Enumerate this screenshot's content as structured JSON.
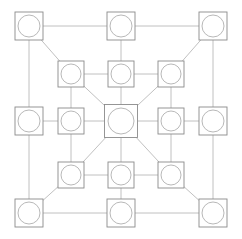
{
  "diagram": {
    "type": "node-link-graph",
    "canvas": {
      "width": 242,
      "height": 239,
      "background": "#ffffff"
    },
    "style": {
      "edge_color": "#b9b9b9",
      "edge_width": 0.9,
      "node_square_stroke": "#8a8a8a",
      "node_square_width": 0.9,
      "node_circle_stroke": "#b0b0b0",
      "node_circle_width": 0.9,
      "node_fill": "#ffffff"
    },
    "grid": {
      "columns_x": [
        29,
        65,
        121,
        177,
        213
      ],
      "rows_y": [
        26,
        74,
        121,
        177,
        213
      ],
      "outer_node_size": 28,
      "inner_node_size": 26,
      "hub_node_size": 33
    },
    "node_count": 17,
    "edge_count": 28,
    "nodes": [
      {
        "id": "n-r1c1",
        "label": "top-left-corner",
        "row": 1,
        "col": 1,
        "cx": 29,
        "cy": 26,
        "size": 28,
        "radius": 11,
        "kind": "corner"
      },
      {
        "id": "n-r1c3",
        "label": "top-center",
        "row": 1,
        "col": 3,
        "cx": 121,
        "cy": 26,
        "size": 28,
        "radius": 11,
        "kind": "edge-mid"
      },
      {
        "id": "n-r1c5",
        "label": "top-right-corner",
        "row": 1,
        "col": 5,
        "cx": 213,
        "cy": 26,
        "size": 28,
        "radius": 11,
        "kind": "corner"
      },
      {
        "id": "n-r2c2",
        "label": "inner-top-left",
        "row": 2,
        "col": 2,
        "cx": 71,
        "cy": 74,
        "size": 26,
        "radius": 10,
        "kind": "inner"
      },
      {
        "id": "n-r2c3",
        "label": "inner-top-center",
        "row": 2,
        "col": 3,
        "cx": 121,
        "cy": 74,
        "size": 26,
        "radius": 10,
        "kind": "inner"
      },
      {
        "id": "n-r2c4",
        "label": "inner-top-right",
        "row": 2,
        "col": 4,
        "cx": 171,
        "cy": 74,
        "size": 26,
        "radius": 10,
        "kind": "inner"
      },
      {
        "id": "n-r3c1",
        "label": "left-middle",
        "row": 3,
        "col": 1,
        "cx": 29,
        "cy": 121,
        "size": 28,
        "radius": 11,
        "kind": "edge-mid"
      },
      {
        "id": "n-r3c2",
        "label": "inner-left",
        "row": 3,
        "col": 2,
        "cx": 71,
        "cy": 121,
        "size": 26,
        "radius": 10,
        "kind": "inner"
      },
      {
        "id": "n-r3c3",
        "label": "center-hub",
        "row": 3,
        "col": 3,
        "cx": 121,
        "cy": 121,
        "size": 33,
        "radius": 13,
        "kind": "hub"
      },
      {
        "id": "n-r3c4",
        "label": "inner-right",
        "row": 3,
        "col": 4,
        "cx": 171,
        "cy": 121,
        "size": 26,
        "radius": 10,
        "kind": "inner"
      },
      {
        "id": "n-r3c5",
        "label": "right-middle",
        "row": 3,
        "col": 5,
        "cx": 213,
        "cy": 121,
        "size": 28,
        "radius": 11,
        "kind": "edge-mid"
      },
      {
        "id": "n-r4c2",
        "label": "inner-bottom-left",
        "row": 4,
        "col": 2,
        "cx": 71,
        "cy": 175,
        "size": 26,
        "radius": 10,
        "kind": "inner"
      },
      {
        "id": "n-r4c3",
        "label": "inner-bottom-center",
        "row": 4,
        "col": 3,
        "cx": 121,
        "cy": 175,
        "size": 26,
        "radius": 10,
        "kind": "inner"
      },
      {
        "id": "n-r4c4",
        "label": "inner-bottom-right",
        "row": 4,
        "col": 4,
        "cx": 171,
        "cy": 175,
        "size": 26,
        "radius": 10,
        "kind": "inner"
      },
      {
        "id": "n-r5c1",
        "label": "bottom-left-corner",
        "row": 5,
        "col": 1,
        "cx": 29,
        "cy": 213,
        "size": 28,
        "radius": 11,
        "kind": "corner"
      },
      {
        "id": "n-r5c3",
        "label": "bottom-center",
        "row": 5,
        "col": 3,
        "cx": 121,
        "cy": 213,
        "size": 28,
        "radius": 11,
        "kind": "edge-mid"
      },
      {
        "id": "n-r5c5",
        "label": "bottom-right-corner",
        "row": 5,
        "col": 5,
        "cx": 213,
        "cy": 213,
        "size": 28,
        "radius": 11,
        "kind": "corner"
      }
    ],
    "edges": [
      {
        "from": "n-r1c1",
        "to": "n-r1c3",
        "orientation": "horizontal"
      },
      {
        "from": "n-r1c3",
        "to": "n-r1c5",
        "orientation": "horizontal"
      },
      {
        "from": "n-r1c1",
        "to": "n-r3c1",
        "orientation": "vertical"
      },
      {
        "from": "n-r1c5",
        "to": "n-r3c5",
        "orientation": "vertical"
      },
      {
        "from": "n-r1c1",
        "to": "n-r2c2",
        "orientation": "diagonal"
      },
      {
        "from": "n-r1c5",
        "to": "n-r2c4",
        "orientation": "diagonal"
      },
      {
        "from": "n-r1c3",
        "to": "n-r2c3",
        "orientation": "vertical"
      },
      {
        "from": "n-r2c2",
        "to": "n-r2c3",
        "orientation": "horizontal"
      },
      {
        "from": "n-r2c3",
        "to": "n-r2c4",
        "orientation": "horizontal"
      },
      {
        "from": "n-r2c2",
        "to": "n-r3c2",
        "orientation": "vertical"
      },
      {
        "from": "n-r2c4",
        "to": "n-r3c4",
        "orientation": "vertical"
      },
      {
        "from": "n-r2c2",
        "to": "n-r3c3",
        "orientation": "diagonal"
      },
      {
        "from": "n-r2c4",
        "to": "n-r3c3",
        "orientation": "diagonal"
      },
      {
        "from": "n-r2c3",
        "to": "n-r3c3",
        "orientation": "vertical"
      },
      {
        "from": "n-r3c1",
        "to": "n-r3c2",
        "orientation": "horizontal"
      },
      {
        "from": "n-r3c2",
        "to": "n-r3c3",
        "orientation": "horizontal"
      },
      {
        "from": "n-r3c3",
        "to": "n-r3c4",
        "orientation": "horizontal"
      },
      {
        "from": "n-r3c4",
        "to": "n-r3c5",
        "orientation": "horizontal"
      },
      {
        "from": "n-r3c1",
        "to": "n-r5c1",
        "orientation": "vertical"
      },
      {
        "from": "n-r3c5",
        "to": "n-r5c5",
        "orientation": "vertical"
      },
      {
        "from": "n-r3c2",
        "to": "n-r4c2",
        "orientation": "vertical"
      },
      {
        "from": "n-r3c4",
        "to": "n-r4c4",
        "orientation": "vertical"
      },
      {
        "from": "n-r3c3",
        "to": "n-r4c2",
        "orientation": "diagonal"
      },
      {
        "from": "n-r3c3",
        "to": "n-r4c4",
        "orientation": "diagonal"
      },
      {
        "from": "n-r3c3",
        "to": "n-r4c3",
        "orientation": "vertical"
      },
      {
        "from": "n-r4c2",
        "to": "n-r4c3",
        "orientation": "horizontal"
      },
      {
        "from": "n-r4c3",
        "to": "n-r4c4",
        "orientation": "horizontal"
      },
      {
        "from": "n-r4c2",
        "to": "n-r5c1",
        "orientation": "diagonal"
      },
      {
        "from": "n-r4c4",
        "to": "n-r5c5",
        "orientation": "diagonal"
      },
      {
        "from": "n-r4c3",
        "to": "n-r5c3",
        "orientation": "vertical"
      },
      {
        "from": "n-r5c1",
        "to": "n-r5c3",
        "orientation": "horizontal"
      },
      {
        "from": "n-r5c3",
        "to": "n-r5c5",
        "orientation": "horizontal"
      }
    ]
  }
}
